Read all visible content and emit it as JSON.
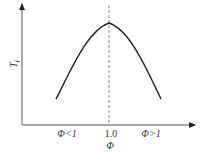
{
  "diagram": {
    "type": "curve",
    "y_axis": {
      "label": "T",
      "subscript": "f"
    },
    "x_axis": {
      "label": "Φ"
    },
    "x_ticks": [
      {
        "label": "Φ<1"
      },
      {
        "label": "1.0"
      },
      {
        "label": "Φ>1"
      }
    ],
    "reference_line": {
      "style": "dashed",
      "at": "1.0"
    },
    "colors": {
      "line": "#222222",
      "axis": "#555555",
      "dash": "#666666",
      "background": "#ffffff"
    }
  }
}
